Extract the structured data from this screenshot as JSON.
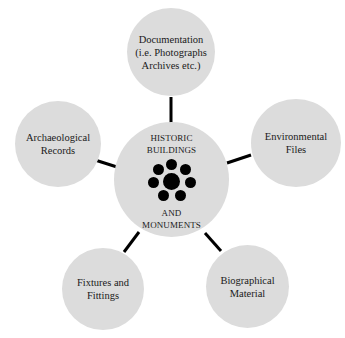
{
  "diagram": {
    "type": "hub-and-spoke",
    "center": {
      "title": "HISTORIC\nBUILDINGS",
      "subtitle": "AND\nMONUMENTS",
      "icon": "dot-cluster-icon"
    },
    "nodes": [
      {
        "id": "documentation",
        "label": "Documentation\n(i.e. Photographs\nArchives etc.)",
        "position": "top"
      },
      {
        "id": "environmental",
        "label": "Environmental\nFiles",
        "position": "right"
      },
      {
        "id": "biographical",
        "label": "Biographical\nMaterial",
        "position": "bottom-right"
      },
      {
        "id": "fixtures",
        "label": "Fixtures and\nFittings",
        "position": "bottom-left"
      },
      {
        "id": "archaeological",
        "label": "Archaeological\nRecords",
        "position": "left"
      }
    ],
    "colors": {
      "bubble": "#dcdcdc",
      "text": "#1a1a1a",
      "connector": "#000000",
      "background": "#ffffff"
    }
  }
}
